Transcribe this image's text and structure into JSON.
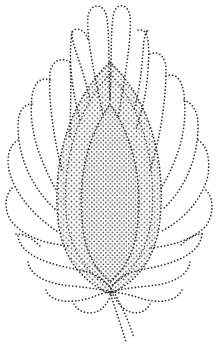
{
  "image": {
    "subject": "dotted line-art paisley leaf motif",
    "background_color": "#ffffff",
    "dot_color": "#2b2b2b",
    "width": 219,
    "height": 348
  }
}
